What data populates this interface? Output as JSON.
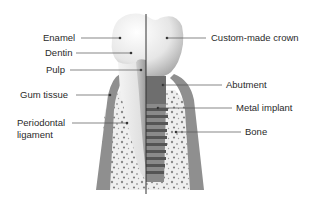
{
  "diagram": {
    "left_side": "Natural tooth",
    "right_side": "Dental implant",
    "colors": {
      "enamel": "#e4e4e4",
      "gum": "#8f8f8f",
      "bone_bg": "#eeeeee",
      "bone_speckle": "#7a7a7a",
      "implant": "#6a6a6a",
      "abutment": "#5a5a5a",
      "leader_line": "#555555",
      "divider": "#333333"
    },
    "labels_left": [
      {
        "id": "enamel",
        "text": "Enamel"
      },
      {
        "id": "dentin",
        "text": "Dentin"
      },
      {
        "id": "pulp",
        "text": "Pulp"
      },
      {
        "id": "gum-tissue",
        "text": "Gum tissue"
      },
      {
        "id": "periodontal-ligament",
        "text_line1": "Periodontal",
        "text_line2": "ligament"
      }
    ],
    "labels_right": [
      {
        "id": "custom-made-crown",
        "text": "Custom-made crown"
      },
      {
        "id": "abutment",
        "text": "Abutment"
      },
      {
        "id": "metal-implant",
        "text": "Metal implant"
      },
      {
        "id": "bone",
        "text": "Bone"
      }
    ]
  }
}
